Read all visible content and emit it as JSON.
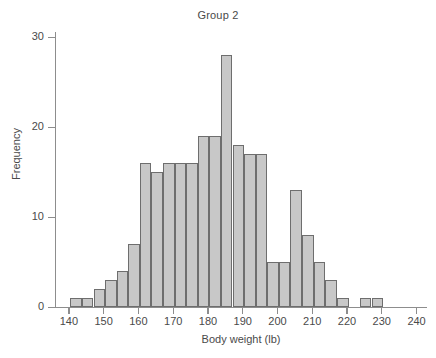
{
  "chart_data": {
    "type": "bar",
    "title": "Group 2",
    "xlabel": "Body weight (lb)",
    "ylabel": "Frequency",
    "xlim": [
      136,
      243
    ],
    "ylim": [
      0,
      31
    ],
    "xticks": [
      140,
      150,
      160,
      170,
      180,
      190,
      200,
      210,
      220,
      230,
      240
    ],
    "yticks": [
      0,
      10,
      20,
      30
    ],
    "grid": false,
    "legend": false,
    "bin_width": 3.333,
    "bin_starts": [
      140.4,
      143.7,
      147.1,
      150.4,
      153.7,
      157.1,
      160.4,
      163.7,
      167.1,
      170.4,
      173.7,
      177.1,
      180.4,
      183.7,
      187.1,
      190.4,
      193.7,
      197.1,
      200.4,
      203.7,
      207.1,
      210.4,
      213.7,
      217.1,
      220.4,
      223.7,
      227.1,
      230.4
    ],
    "categories": [
      "140.4-143.7",
      "143.7-147.1",
      "147.1-150.4",
      "150.4-153.7",
      "153.7-157.1",
      "157.1-160.4",
      "160.4-163.7",
      "163.7-167.1",
      "167.1-170.4",
      "170.4-173.7",
      "173.7-177.1",
      "177.1-180.4",
      "180.4-183.7",
      "183.7-187.1",
      "187.1-190.4",
      "190.4-193.7",
      "193.7-197.1",
      "197.1-200.4",
      "200.4-203.7",
      "203.7-207.1",
      "207.1-210.4",
      "210.4-213.7",
      "213.7-217.1",
      "217.1-220.4",
      "220.4-223.7",
      "223.7-227.1",
      "227.1-230.4",
      "230.4-233.7"
    ],
    "values": [
      1,
      1,
      2,
      3,
      4,
      7,
      16,
      15,
      16,
      16,
      16,
      19,
      19,
      28,
      18,
      17,
      17,
      5,
      5,
      13,
      8,
      5,
      3,
      1,
      0,
      1,
      1,
      0
    ],
    "bar_fill_color": "#c8c8c8",
    "bar_edge_color": "#6e6e6e",
    "axis_color": "#8d8d8d",
    "text_color": "#4a4a4a",
    "background_color": "#ffffff"
  }
}
